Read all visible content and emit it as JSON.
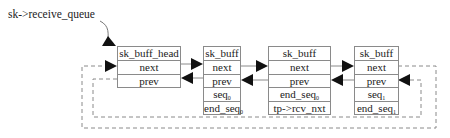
{
  "title_label": "sk->receive_queue",
  "boxes": [
    {
      "id": "head",
      "rows": [
        {
          "text": "sk_buff_head",
          "sub": ""
        },
        {
          "text": "next",
          "sub": ""
        },
        {
          "text": "prev",
          "sub": ""
        }
      ]
    },
    {
      "id": "buff0",
      "rows": [
        {
          "text": "sk_buff",
          "sub": ""
        },
        {
          "text": "next",
          "sub": ""
        },
        {
          "text": "prev",
          "sub": ""
        },
        {
          "text": "seq",
          "sub": "0"
        },
        {
          "text": "end_seq",
          "sub": "0"
        }
      ]
    },
    {
      "id": "buff_mid",
      "rows": [
        {
          "text": "sk_buff",
          "sub": ""
        },
        {
          "text": "next",
          "sub": ""
        },
        {
          "text": "prev",
          "sub": ""
        },
        {
          "text": "end_seq",
          "sub": "0"
        },
        {
          "text": "tp->rcv_nxt",
          "sub": ""
        }
      ]
    },
    {
      "id": "buff1",
      "rows": [
        {
          "text": "sk_buff",
          "sub": ""
        },
        {
          "text": "next",
          "sub": ""
        },
        {
          "text": "prev",
          "sub": ""
        },
        {
          "text": "seq",
          "sub": "1"
        },
        {
          "text": "end_seq",
          "sub": "1"
        }
      ]
    }
  ],
  "colors": {
    "line": "#8a8a8a",
    "arrow": "#111111",
    "dashed": "#8a8a8a"
  }
}
